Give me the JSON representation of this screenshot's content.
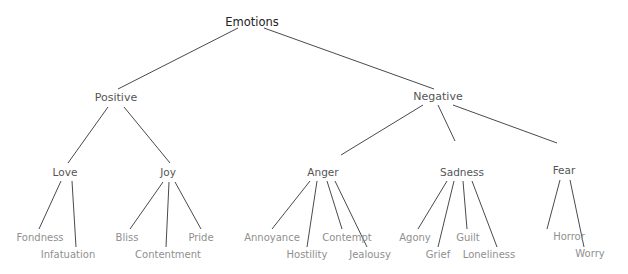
{
  "diagram": {
    "type": "tree",
    "root": "Emotions",
    "nodes": [
      {
        "id": "emotions",
        "label": "Emotions",
        "level": 0,
        "parent": null
      },
      {
        "id": "positive",
        "label": "Positive",
        "level": 1,
        "parent": "emotions"
      },
      {
        "id": "negative",
        "label": "Negative",
        "level": 1,
        "parent": "emotions"
      },
      {
        "id": "love",
        "label": "Love",
        "level": 2,
        "parent": "positive"
      },
      {
        "id": "joy",
        "label": "Joy",
        "level": 2,
        "parent": "positive"
      },
      {
        "id": "anger",
        "label": "Anger",
        "level": 2,
        "parent": "negative"
      },
      {
        "id": "sadness",
        "label": "Sadness",
        "level": 2,
        "parent": "negative"
      },
      {
        "id": "fear",
        "label": "Fear",
        "level": 2,
        "parent": "negative"
      },
      {
        "id": "fondness",
        "label": "Fondness",
        "level": 3,
        "parent": "love"
      },
      {
        "id": "infatuation",
        "label": "Infatuation",
        "level": 3,
        "parent": "love"
      },
      {
        "id": "bliss",
        "label": "Bliss",
        "level": 3,
        "parent": "joy"
      },
      {
        "id": "contentment",
        "label": "Contentment",
        "level": 3,
        "parent": "joy"
      },
      {
        "id": "pride",
        "label": "Pride",
        "level": 3,
        "parent": "joy"
      },
      {
        "id": "annoyance",
        "label": "Annoyance",
        "level": 3,
        "parent": "anger"
      },
      {
        "id": "hostility",
        "label": "Hostility",
        "level": 3,
        "parent": "anger"
      },
      {
        "id": "contempt",
        "label": "Contempt",
        "level": 3,
        "parent": "anger"
      },
      {
        "id": "jealousy",
        "label": "Jealousy",
        "level": 3,
        "parent": "anger"
      },
      {
        "id": "agony",
        "label": "Agony",
        "level": 3,
        "parent": "sadness"
      },
      {
        "id": "grief",
        "label": "Grief",
        "level": 3,
        "parent": "sadness"
      },
      {
        "id": "guilt",
        "label": "Guilt",
        "level": 3,
        "parent": "sadness"
      },
      {
        "id": "loneliness",
        "label": "Loneliness",
        "level": 3,
        "parent": "sadness"
      },
      {
        "id": "horror",
        "label": "Horror",
        "level": 3,
        "parent": "fear"
      },
      {
        "id": "worry",
        "label": "Worry",
        "level": 3,
        "parent": "fear"
      }
    ]
  }
}
